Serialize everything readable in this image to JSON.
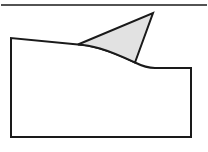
{
  "figure": {
    "width": 208,
    "height": 152,
    "background_color": "#ffffff",
    "stroke_color": "#1a1a1a",
    "fill_color": "#e2e2e2",
    "body_fill_color": "#ffffff",
    "top_rule": {
      "name": "top-horizontal-rule",
      "x1": 1,
      "y1": 5,
      "x2": 207,
      "y2": 5,
      "stroke_width": 1.6
    },
    "body_shape": {
      "name": "main-body-outline",
      "description": "large outlined block with undulating upper boundary",
      "path": "M 11 38 L 11 137 L 191 137 L 191 68 L 155 68 C 146 68 140 65 135 62.5 C 120 55 100 48 88 45.6 C 84 44.9 80.5 44.6 78 44.5 Z",
      "stroke_width": 2.0
    },
    "fin_shape": {
      "name": "shark-fin-triangle",
      "description": "gray filled triangular fin rising from the upper boundary",
      "path": "M 78 44.5 L 153 13 L 135 62.5 C 124 57.5 112 52 100 48.5 C 92 46.3 84.5 44.9 78 44.5 Z",
      "stroke_width": 2.0,
      "vertices": [
        {
          "name": "fin-base-left",
          "x": 78,
          "y": 44.5
        },
        {
          "name": "fin-apex",
          "x": 153,
          "y": 13
        },
        {
          "name": "fin-base-right",
          "x": 135,
          "y": 62.5
        }
      ]
    }
  }
}
